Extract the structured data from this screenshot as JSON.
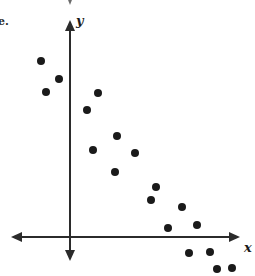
{
  "figure": {
    "item_label": "e.",
    "width": 255,
    "height": 276,
    "background_color": "#ffffff",
    "ink_color": "#1a1a1a"
  },
  "axes": {
    "x_label": "x",
    "y_label": "y",
    "x_axis_y_px": 237,
    "y_axis_x_px": 70,
    "x_axis_left_px": 11,
    "x_axis_right_px": 240,
    "y_axis_top_px": 20,
    "y_axis_bottom_px": 261,
    "arrowheads": [
      "left",
      "right",
      "up",
      "down"
    ],
    "stroke_color": "#2b2b2b",
    "stroke_width": 2
  },
  "partial_arrow_top": {
    "present": true,
    "x_px": 70,
    "y_px": 0,
    "note": "clipped arrowhead from the figure above"
  },
  "chart_data": {
    "type": "scatter",
    "title": "",
    "xlabel": "x",
    "ylabel": "y",
    "grid": false,
    "legend": null,
    "axis_origin_px": [
      70,
      237
    ],
    "trend": "negative / decreasing",
    "point_radius_px": 4,
    "point_color": "#1a1a1a",
    "n_points": 18,
    "points_px": [
      [
        41,
        61
      ],
      [
        59,
        79
      ],
      [
        46,
        92
      ],
      [
        98,
        93
      ],
      [
        87,
        110
      ],
      [
        117,
        136
      ],
      [
        93,
        150
      ],
      [
        135,
        153
      ],
      [
        115,
        172
      ],
      [
        156,
        187
      ],
      [
        151,
        200
      ],
      [
        182,
        207
      ],
      [
        168,
        228
      ],
      [
        197,
        225
      ],
      [
        189,
        253
      ],
      [
        210,
        252
      ],
      [
        217,
        269
      ],
      [
        232,
        268
      ]
    ],
    "x": [
      -29,
      -11,
      -24,
      28,
      17,
      47,
      23,
      65,
      45,
      86,
      81,
      112,
      98,
      127,
      119,
      140,
      147,
      162
    ],
    "y": [
      176,
      158,
      145,
      144,
      127,
      101,
      87,
      84,
      65,
      50,
      37,
      30,
      9,
      12,
      -16,
      -15,
      -32,
      -31
    ]
  }
}
